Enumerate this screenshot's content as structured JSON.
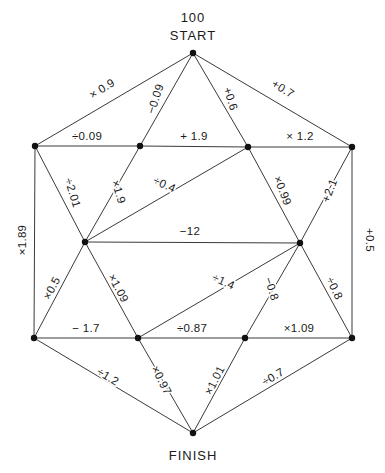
{
  "diagram": {
    "type": "edge-labeled-network-puzzle",
    "title_top_value": "100",
    "title_top_label": "START",
    "title_bottom_label": "FINISH",
    "node_color": "#111111",
    "edge_color": "#3a3a3a",
    "text_color": "#1a1a1a",
    "background": "#ffffff",
    "nodes": [
      {
        "id": "start",
        "name": "start-node",
        "x": 193,
        "y": 53
      },
      {
        "id": "tl",
        "name": "top-left-node",
        "x": 35,
        "y": 146
      },
      {
        "id": "tml",
        "name": "top-mid-left-node",
        "x": 140,
        "y": 146
      },
      {
        "id": "tmr",
        "name": "top-mid-right-node",
        "x": 248,
        "y": 147
      },
      {
        "id": "tr",
        "name": "top-right-node",
        "x": 352,
        "y": 147
      },
      {
        "id": "ml",
        "name": "middle-left-node",
        "x": 85,
        "y": 242
      },
      {
        "id": "mr",
        "name": "middle-right-node",
        "x": 300,
        "y": 243
      },
      {
        "id": "bl",
        "name": "bottom-left-node",
        "x": 34,
        "y": 338
      },
      {
        "id": "bml",
        "name": "bottom-mid-left-node",
        "x": 138,
        "y": 338
      },
      {
        "id": "bmr",
        "name": "bottom-mid-right-node",
        "x": 245,
        "y": 338
      },
      {
        "id": "br",
        "name": "bottom-right-node",
        "x": 352,
        "y": 338
      },
      {
        "id": "finish",
        "name": "finish-node",
        "x": 193,
        "y": 433
      }
    ],
    "edges": [
      {
        "id": "e01",
        "name": "edge-start-to-top-left",
        "from": "start",
        "to": "tl",
        "label": "× 0.9",
        "lx": 104,
        "ly": 92,
        "rot": -32
      },
      {
        "id": "e02",
        "name": "edge-start-to-top-mid-left",
        "from": "start",
        "to": "tml",
        "label": "−0.09",
        "lx": 159,
        "ly": 100,
        "rot": -72
      },
      {
        "id": "e03",
        "name": "edge-start-to-top-mid-right",
        "from": "start",
        "to": "tmr",
        "label": "+0.6",
        "lx": 227,
        "ly": 100,
        "rot": 72
      },
      {
        "id": "e04",
        "name": "edge-start-to-top-right",
        "from": "start",
        "to": "tr",
        "label": "+0.7",
        "lx": 281,
        "ly": 92,
        "rot": 32
      },
      {
        "id": "e05",
        "name": "edge-top-left-to-top-mid-left",
        "from": "tl",
        "to": "tml",
        "label": "÷0.09",
        "lx": 87,
        "ly": 140,
        "rot": 0
      },
      {
        "id": "e06",
        "name": "edge-top-mid-left-to-top-mid-right",
        "from": "tml",
        "to": "tmr",
        "label": "+ 1.9",
        "lx": 194,
        "ly": 140,
        "rot": 0
      },
      {
        "id": "e07",
        "name": "edge-top-mid-right-to-top-right",
        "from": "tmr",
        "to": "tr",
        "label": "× 1.2",
        "lx": 300,
        "ly": 140,
        "rot": 0
      },
      {
        "id": "e08",
        "name": "edge-top-left-to-middle-left",
        "from": "tl",
        "to": "ml",
        "label": "÷2.01",
        "lx": 69,
        "ly": 194,
        "rot": 73
      },
      {
        "id": "e09",
        "name": "edge-top-mid-left-to-middle-left",
        "from": "tml",
        "to": "ml",
        "label": "×1.9",
        "lx": 115,
        "ly": 193,
        "rot": 73
      },
      {
        "id": "e10",
        "name": "edge-top-mid-right-to-middle-left",
        "from": "tmr",
        "to": "ml",
        "label": "÷0.4",
        "lx": 163,
        "ly": 188,
        "rot": 24
      },
      {
        "id": "e11",
        "name": "edge-top-mid-right-to-middle-right",
        "from": "tmr",
        "to": "mr",
        "label": "×0.99",
        "lx": 279,
        "ly": 192,
        "rot": 69
      },
      {
        "id": "e12",
        "name": "edge-top-right-to-middle-right",
        "from": "tr",
        "to": "mr",
        "label": "+2.1",
        "lx": 333,
        "ly": 192,
        "rot": -69
      },
      {
        "id": "e13",
        "name": "edge-top-left-to-bottom-left",
        "from": "tl",
        "to": "bl",
        "label": "×1.89",
        "lx": 26,
        "ly": 240,
        "rot": -90
      },
      {
        "id": "e14",
        "name": "edge-top-right-to-bottom-right",
        "from": "tr",
        "to": "br",
        "label": "+0.5",
        "lx": 366,
        "ly": 240,
        "rot": 90
      },
      {
        "id": "e15",
        "name": "edge-middle-left-to-middle-right",
        "from": "ml",
        "to": "mr",
        "label": "−12",
        "lx": 190,
        "ly": 235,
        "rot": 0
      },
      {
        "id": "e16",
        "name": "edge-middle-left-to-bottom-left",
        "from": "ml",
        "to": "bl",
        "label": "×0.5",
        "lx": 55,
        "ly": 290,
        "rot": -62
      },
      {
        "id": "e17",
        "name": "edge-middle-left-to-bottom-mid-left",
        "from": "ml",
        "to": "bml",
        "label": "×1.09",
        "lx": 115,
        "ly": 290,
        "rot": 62
      },
      {
        "id": "e18",
        "name": "edge-middle-right-to-bottom-mid-left",
        "from": "mr",
        "to": "bml",
        "label": "÷1.4",
        "lx": 222,
        "ly": 285,
        "rot": 24
      },
      {
        "id": "e19",
        "name": "edge-middle-right-to-bottom-mid-right",
        "from": "mr",
        "to": "bmr",
        "label": "−0.8",
        "lx": 268,
        "ly": 290,
        "rot": 72
      },
      {
        "id": "e20",
        "name": "edge-middle-right-to-bottom-right",
        "from": "mr",
        "to": "br",
        "label": "÷0.8",
        "lx": 331,
        "ly": 290,
        "rot": 65
      },
      {
        "id": "e21",
        "name": "edge-bottom-left-to-bottom-mid-left",
        "from": "bl",
        "to": "bml",
        "label": "− 1.7",
        "lx": 86,
        "ly": 332,
        "rot": 0
      },
      {
        "id": "e22",
        "name": "edge-bottom-mid-left-to-bottom-mid-right",
        "from": "bml",
        "to": "bmr",
        "label": "÷0.87",
        "lx": 192,
        "ly": 332,
        "rot": 0
      },
      {
        "id": "e23",
        "name": "edge-bottom-mid-right-to-bottom-right",
        "from": "bmr",
        "to": "br",
        "label": "×1.09",
        "lx": 299,
        "ly": 332,
        "rot": 0
      },
      {
        "id": "e24",
        "name": "edge-bottom-left-to-finish",
        "from": "bl",
        "to": "finish",
        "label": "÷1.2",
        "lx": 106,
        "ly": 380,
        "rot": 31
      },
      {
        "id": "e25",
        "name": "edge-bottom-mid-left-to-finish",
        "from": "bml",
        "to": "finish",
        "label": "×0.97",
        "lx": 158,
        "ly": 382,
        "rot": 63
      },
      {
        "id": "e26",
        "name": "edge-bottom-mid-right-to-finish",
        "from": "bmr",
        "to": "finish",
        "label": "×1.01",
        "lx": 218,
        "ly": 382,
        "rot": -63
      },
      {
        "id": "e27",
        "name": "edge-bottom-right-to-finish",
        "from": "br",
        "to": "finish",
        "label": "÷0.7",
        "lx": 275,
        "ly": 380,
        "rot": -31
      }
    ]
  }
}
